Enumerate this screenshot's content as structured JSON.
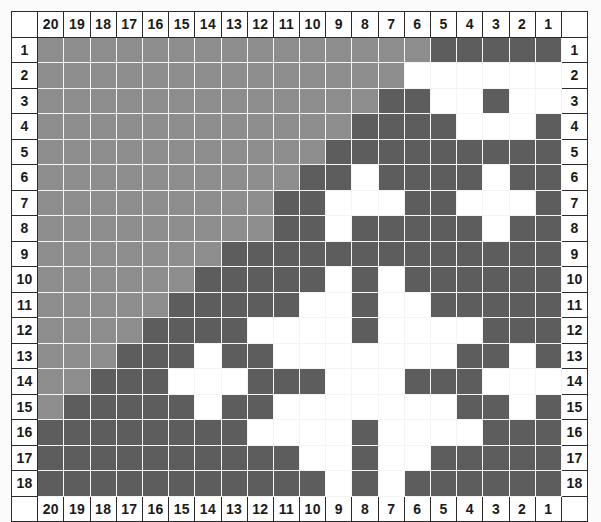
{
  "chart": {
    "columns_top": [
      "20",
      "19",
      "18",
      "17",
      "16",
      "15",
      "14",
      "13",
      "12",
      "11",
      "10",
      "9",
      "8",
      "7",
      "6",
      "5",
      "4",
      "3",
      "2",
      "1"
    ],
    "columns_bottom": [
      "20",
      "19",
      "18",
      "17",
      "16",
      "15",
      "14",
      "13",
      "12",
      "11",
      "10",
      "9",
      "8",
      "7",
      "6",
      "5",
      "4",
      "3",
      "2",
      "1"
    ],
    "rows_left": [
      "1",
      "2",
      "3",
      "4",
      "5",
      "6",
      "7",
      "8",
      "9",
      "10",
      "11",
      "12",
      "13",
      "14",
      "15",
      "16",
      "17",
      "18"
    ],
    "rows_right": [
      "1",
      "2",
      "3",
      "4",
      "5",
      "6",
      "7",
      "8",
      "9",
      "10",
      "11",
      "12",
      "13",
      "14",
      "15",
      "16",
      "17",
      "18"
    ],
    "colors": {
      "medium_gray": "#8d8d8d",
      "dark_gray": "#5d5d5d",
      "white": "#ffffff",
      "grid_line": "#f4f4f4",
      "label_border": "#2b2b2b",
      "label_text": "#1a1a1a",
      "background": "#fbfbfb"
    },
    "legend_keys": [
      "G = medium gray",
      "D = dark gray",
      "W = white"
    ]
  },
  "chart_data": {
    "type": "heatmap",
    "xlabel": "",
    "ylabel": "",
    "categories": [
      "20",
      "19",
      "18",
      "17",
      "16",
      "15",
      "14",
      "13",
      "12",
      "11",
      "10",
      "9",
      "8",
      "7",
      "6",
      "5",
      "4",
      "3",
      "2",
      "1"
    ],
    "row_labels": [
      "1",
      "2",
      "3",
      "4",
      "5",
      "6",
      "7",
      "8",
      "9",
      "10",
      "11",
      "12",
      "13",
      "14",
      "15",
      "16",
      "17",
      "18"
    ],
    "value_legend": {
      "G": "medium gray",
      "D": "dark gray",
      "W": "white"
    },
    "grid": [
      [
        "G",
        "G",
        "G",
        "G",
        "G",
        "G",
        "G",
        "G",
        "G",
        "G",
        "G",
        "G",
        "G",
        "G",
        "G",
        "D",
        "D",
        "D",
        "D",
        "D"
      ],
      [
        "G",
        "G",
        "G",
        "G",
        "G",
        "G",
        "G",
        "G",
        "G",
        "G",
        "G",
        "G",
        "G",
        "G",
        "W",
        "W",
        "W",
        "W",
        "W",
        "W"
      ],
      [
        "G",
        "G",
        "G",
        "G",
        "G",
        "G",
        "G",
        "G",
        "G",
        "G",
        "G",
        "G",
        "G",
        "D",
        "D",
        "W",
        "W",
        "D",
        "W",
        "W"
      ],
      [
        "G",
        "G",
        "G",
        "G",
        "G",
        "G",
        "G",
        "G",
        "G",
        "G",
        "G",
        "G",
        "D",
        "D",
        "D",
        "D",
        "W",
        "W",
        "W",
        "D"
      ],
      [
        "G",
        "G",
        "G",
        "G",
        "G",
        "G",
        "G",
        "G",
        "G",
        "G",
        "G",
        "D",
        "D",
        "D",
        "D",
        "D",
        "D",
        "D",
        "D",
        "D"
      ],
      [
        "G",
        "G",
        "G",
        "G",
        "G",
        "G",
        "G",
        "G",
        "G",
        "G",
        "D",
        "D",
        "W",
        "D",
        "D",
        "D",
        "D",
        "W",
        "D",
        "D"
      ],
      [
        "G",
        "G",
        "G",
        "G",
        "G",
        "G",
        "G",
        "G",
        "G",
        "D",
        "D",
        "W",
        "W",
        "W",
        "D",
        "D",
        "W",
        "W",
        "W",
        "D"
      ],
      [
        "G",
        "G",
        "G",
        "G",
        "G",
        "G",
        "G",
        "G",
        "G",
        "D",
        "D",
        "W",
        "D",
        "D",
        "D",
        "D",
        "D",
        "W",
        "D",
        "D"
      ],
      [
        "G",
        "G",
        "G",
        "G",
        "G",
        "G",
        "G",
        "D",
        "D",
        "D",
        "D",
        "D",
        "D",
        "D",
        "D",
        "D",
        "D",
        "D",
        "D",
        "D"
      ],
      [
        "G",
        "G",
        "G",
        "G",
        "G",
        "G",
        "D",
        "D",
        "D",
        "D",
        "D",
        "W",
        "D",
        "W",
        "D",
        "D",
        "D",
        "D",
        "D",
        "D"
      ],
      [
        "G",
        "G",
        "G",
        "G",
        "G",
        "D",
        "D",
        "D",
        "D",
        "D",
        "W",
        "W",
        "D",
        "W",
        "W",
        "D",
        "D",
        "D",
        "D",
        "D"
      ],
      [
        "G",
        "G",
        "G",
        "G",
        "D",
        "D",
        "D",
        "D",
        "W",
        "W",
        "W",
        "W",
        "D",
        "W",
        "W",
        "W",
        "W",
        "D",
        "D",
        "D"
      ],
      [
        "G",
        "G",
        "G",
        "D",
        "D",
        "D",
        "W",
        "D",
        "D",
        "W",
        "W",
        "W",
        "W",
        "W",
        "W",
        "W",
        "D",
        "D",
        "W",
        "D"
      ],
      [
        "G",
        "G",
        "D",
        "D",
        "D",
        "W",
        "W",
        "W",
        "D",
        "D",
        "D",
        "W",
        "W",
        "W",
        "D",
        "D",
        "D",
        "W",
        "W",
        "W"
      ],
      [
        "G",
        "D",
        "D",
        "D",
        "D",
        "D",
        "W",
        "D",
        "D",
        "W",
        "W",
        "W",
        "W",
        "W",
        "W",
        "W",
        "D",
        "D",
        "W",
        "D"
      ],
      [
        "D",
        "D",
        "D",
        "D",
        "D",
        "D",
        "D",
        "D",
        "W",
        "W",
        "W",
        "W",
        "D",
        "W",
        "W",
        "W",
        "W",
        "D",
        "D",
        "D"
      ],
      [
        "D",
        "D",
        "D",
        "D",
        "D",
        "D",
        "D",
        "D",
        "D",
        "D",
        "W",
        "W",
        "D",
        "W",
        "W",
        "D",
        "D",
        "D",
        "D",
        "D"
      ],
      [
        "D",
        "D",
        "D",
        "D",
        "D",
        "D",
        "D",
        "D",
        "D",
        "D",
        "D",
        "W",
        "D",
        "W",
        "D",
        "D",
        "D",
        "D",
        "D",
        "D"
      ]
    ]
  }
}
